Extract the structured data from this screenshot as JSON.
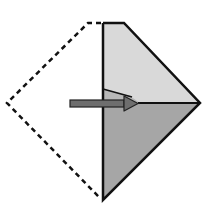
{
  "diagram": {
    "type": "origami-fold-step",
    "colors": {
      "background": "#ffffff",
      "upper_face": "#d9d9d9",
      "lower_face": "#a6a6a6",
      "inner_flap": "#b8b8b8",
      "outline": "#111111",
      "arrow_fill": "#6e6e6e",
      "arrow_stroke": "#222222"
    },
    "elements": {
      "dashed_outline": "folded-away left half",
      "arrow": "fold direction right",
      "crease": "horizontal center crease"
    }
  }
}
